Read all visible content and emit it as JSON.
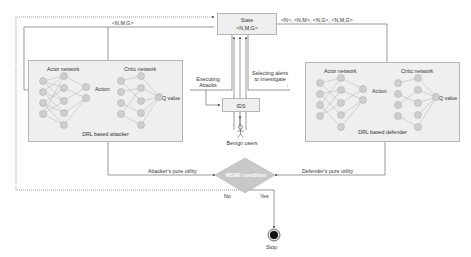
{
  "diagram": {
    "state": {
      "title": "State",
      "value": "<N,M,G>"
    },
    "ids": {
      "label": "IDS"
    },
    "benign_users": {
      "label": "Benign users"
    },
    "attacker": {
      "label": "DRL based attacker",
      "actor_label": "Actor network",
      "critic_label": "Critic network",
      "action_label": "Action",
      "qvalue_label": "Q value"
    },
    "defender": {
      "label": "DRL based defender",
      "actor_label": "Actor network",
      "critic_label": "Critic network",
      "action_label": "Action",
      "qvalue_label": "Q value"
    },
    "edges": {
      "attacker_state": "<N,M,G>",
      "defender_state": "<N>, <N,M>, <N,G>, <N,M,G>",
      "executing_attacks": "Executing Attacks",
      "selecting_alerts": "Selecting alerts to investigate",
      "attacker_utility": "Attacker's pure utility",
      "defender_utility": "Defender's pure utility",
      "no": "No",
      "yes": "Yes"
    },
    "decision": {
      "label": "MSNE condition"
    },
    "stop": {
      "label": "Stop"
    },
    "colors": {
      "box_fill": "#efefef",
      "node_fill": "#d9d9d9",
      "diamond_fill": "#c8c8c8",
      "line": "#555555"
    }
  }
}
